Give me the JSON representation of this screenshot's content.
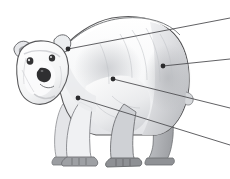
{
  "figure": {
    "title": "Polar bear",
    "view": "full-body side profile facing left",
    "style": "grayscale pencil and wash illustration",
    "caption": "Polar bear shown in side profile with four anatomical callout markers connected by leader lines to labels at the right.",
    "canvas": {
      "width": 230,
      "height": 179
    },
    "background_color": "#ffffff"
  },
  "palette": {
    "background": "#ffffff",
    "outline": "#58585a",
    "outline_soft": "#8d8e91",
    "fur_highlight": "#ffffff",
    "fur_light": "#f4f5f6",
    "fur_mid": "#dcdde0",
    "fur_shadow": "#c2c4c8",
    "fur_deep_shadow": "#a7a9ad",
    "paw_gray": "#96989c",
    "paw_dark": "#7f8185",
    "nose_dark": "#2f2f31",
    "eye_dark": "#333335",
    "leader_line": "#4f4f52",
    "callout_dot": "#2b2b2d"
  },
  "callouts": [
    {
      "id": "callout-head",
      "name": "head-marker",
      "dot": {
        "x": 68,
        "y": 49
      },
      "line_end": {
        "x": 230,
        "y": 18
      },
      "label": "",
      "label_visible": false,
      "region": "head"
    },
    {
      "id": "callout-hindquarter",
      "name": "hindquarter-marker",
      "dot": {
        "x": 163,
        "y": 66
      },
      "line_end": {
        "x": 230,
        "y": 59
      },
      "label": "",
      "label_visible": false,
      "region": "rump"
    },
    {
      "id": "callout-torso",
      "name": "torso-marker",
      "dot": {
        "x": 113,
        "y": 79
      },
      "line_end": {
        "x": 230,
        "y": 108
      },
      "label": "",
      "label_visible": false,
      "region": "belly"
    },
    {
      "id": "callout-foreleg",
      "name": "foreleg-marker",
      "dot": {
        "x": 78,
        "y": 98
      },
      "line_end": {
        "x": 230,
        "y": 145
      },
      "label": "",
      "label_visible": false,
      "region": "foreleg"
    }
  ],
  "anatomy_parts": [
    {
      "name": "ear-left",
      "label": ""
    },
    {
      "name": "ear-right",
      "label": ""
    },
    {
      "name": "eye-left",
      "label": ""
    },
    {
      "name": "eye-right",
      "label": ""
    },
    {
      "name": "nose",
      "label": ""
    },
    {
      "name": "muzzle",
      "label": ""
    },
    {
      "name": "neck",
      "label": ""
    },
    {
      "name": "shoulder",
      "label": ""
    },
    {
      "name": "back",
      "label": ""
    },
    {
      "name": "rump",
      "label": ""
    },
    {
      "name": "tail",
      "label": ""
    },
    {
      "name": "front-leg-near",
      "label": ""
    },
    {
      "name": "front-leg-far",
      "label": ""
    },
    {
      "name": "hind-leg-near",
      "label": ""
    },
    {
      "name": "hind-leg-far",
      "label": ""
    },
    {
      "name": "front-paw-near",
      "label": ""
    },
    {
      "name": "front-paw-far",
      "label": ""
    },
    {
      "name": "hind-paw-near",
      "label": ""
    },
    {
      "name": "hind-paw-far",
      "label": ""
    }
  ]
}
